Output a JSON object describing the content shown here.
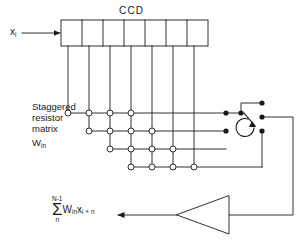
{
  "diagram": {
    "ccd": {
      "label": "CCD",
      "cells": 7,
      "taps": 7
    },
    "input": {
      "label": "x",
      "sub": "i"
    },
    "matrix": {
      "line1": "Staggered",
      "line2": "resistor",
      "line3": "matrix",
      "symbol": "W",
      "symbol_sub": "in",
      "rows": 4,
      "nodes_per_row": 4,
      "stagger": 1
    },
    "switch": {
      "name": "rotary-selector",
      "contacts": 4
    },
    "amplifier": {
      "name": "output-amplifier",
      "orientation": "points-left"
    },
    "output": {
      "sigma": "Σ",
      "upper": "N-1",
      "lower": "n",
      "weight": "W",
      "weight_sub": "in",
      "signal": "x",
      "signal_sub": "i + n"
    },
    "colors": {
      "line": "#1a1a1a",
      "node_fill": "#ffffff",
      "contact_fill": "#1a1a1a",
      "background": "#ffffff"
    }
  }
}
